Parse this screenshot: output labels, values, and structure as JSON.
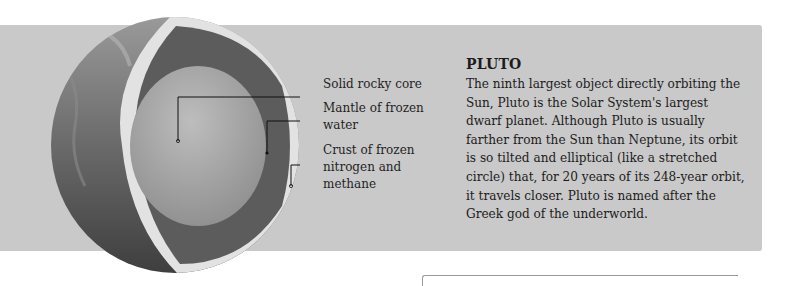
{
  "figure": {
    "planet": "Pluto",
    "callouts": [
      {
        "label": "Solid rocky core"
      },
      {
        "label": "Mantle of frozen water"
      },
      {
        "label": "Crust of frozen nitrogen and methane"
      }
    ]
  },
  "info": {
    "title": "PLUTO",
    "body": "The ninth largest object directly orbiting the Sun, Pluto is the Solar System's largest dwarf planet. Although Pluto is usually farther from the Sun than Neptune, its orbit is so tilted and elliptical (like a stretched circle) that, for 20 years of its 248-year orbit, it travels closer. Pluto is named after the Greek god of the underworld."
  },
  "colors": {
    "panel": "#c9c9c9",
    "core": "#a7a7a7",
    "mantle": "#5e5e5e",
    "crust": "#e4e4e4",
    "surface": "#6f6f6f"
  }
}
